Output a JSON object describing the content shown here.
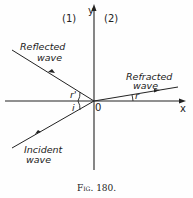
{
  "figure": {
    "caption": "Fig. 180.",
    "axes": {
      "x_label": "x",
      "y_label": "y",
      "origin_label": "0"
    },
    "regions": {
      "left": "(1)",
      "right": "(2)"
    },
    "waves": {
      "reflected": {
        "line1": "Reflected",
        "line2": "wave"
      },
      "refracted": {
        "line1": "Refracted",
        "line2": "wave"
      },
      "incident": {
        "line1": "Incident",
        "line2": "wave"
      }
    },
    "angles": {
      "incidence": "i",
      "reflection": "r'",
      "refraction": "r"
    }
  }
}
